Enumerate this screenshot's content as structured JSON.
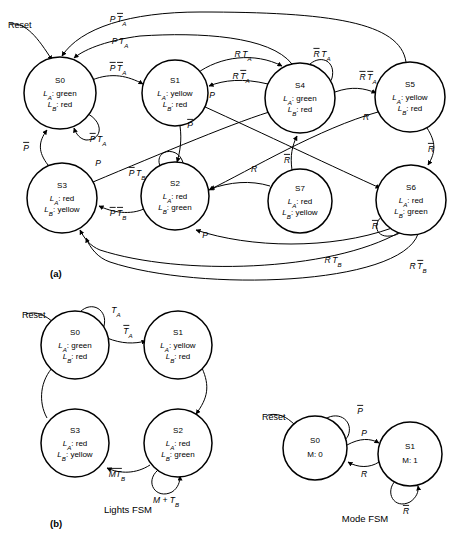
{
  "figure": {
    "part_a_label": "(a)",
    "part_b_label": "(b)",
    "lights_fsm_caption": "Lights FSM",
    "mode_fsm_caption": "Mode FSM",
    "reset_label": "Reset"
  },
  "outputs": {
    "la": "L",
    "la_sub": "A",
    "lb": "L",
    "lb_sub": "B",
    "colon": ":",
    "green": "green",
    "red": "red",
    "yellow": "yellow"
  },
  "diagram_a": {
    "states": [
      {
        "id": "S0",
        "name": "S0",
        "la": "green",
        "lb": "red",
        "cx": 60,
        "cy": 93,
        "r": 36
      },
      {
        "id": "S1",
        "name": "S1",
        "la": "yellow",
        "lb": "red",
        "cx": 175,
        "cy": 93,
        "r": 33
      },
      {
        "id": "S4",
        "name": "S4",
        "la": "green",
        "lb": "red",
        "cx": 300,
        "cy": 98,
        "r": 35
      },
      {
        "id": "S5",
        "name": "S5",
        "la": "yellow",
        "lb": "red",
        "cx": 410,
        "cy": 97,
        "r": 35
      },
      {
        "id": "S3",
        "name": "S3",
        "la": "red",
        "lb": "yellow",
        "cx": 62,
        "cy": 198,
        "r": 35
      },
      {
        "id": "S2",
        "name": "S2",
        "la": "red",
        "lb": "green",
        "cx": 175,
        "cy": 196,
        "r": 34
      },
      {
        "id": "S7",
        "name": "S7",
        "la": "red",
        "lb": "yellow",
        "cx": 300,
        "cy": 201,
        "r": 32
      },
      {
        "id": "S6",
        "name": "S6",
        "la": "red",
        "lb": "green",
        "cx": 411,
        "cy": 200,
        "r": 35
      }
    ],
    "transitions": [
      {
        "from": "S5",
        "to": "S0",
        "label": "P T̅A",
        "main": "P",
        "bar": "T",
        "sub": "A",
        "barred": true,
        "lx": 118,
        "ly": 22
      },
      {
        "from": "S4",
        "to": "S0",
        "label": "P TA",
        "main": "P",
        "bar": "T",
        "sub": "A",
        "barred": false,
        "lx": 120,
        "ly": 44
      },
      {
        "from": "S0",
        "to": "S1",
        "label": "P̅ T̅A",
        "main": "P",
        "bar": "T",
        "sub": "A",
        "barred": true,
        "lx": 120,
        "ly": 71
      },
      {
        "from": "S0",
        "to": "S0",
        "label": "P̅ TA",
        "main": "P",
        "bar": "T",
        "sub": "A",
        "barred": false,
        "lx": 96,
        "ly": 139
      },
      {
        "from": "S1",
        "to": "S4",
        "label": "R TA",
        "main": "R",
        "bar": "T",
        "sub": "A",
        "barred": false,
        "lx": 243,
        "ly": 57
      },
      {
        "from": "S4",
        "to": "S1",
        "label": "R T̅A",
        "main": "R",
        "bar": "T",
        "sub": "A",
        "barred": true,
        "lx": 240,
        "ly": 79
      },
      {
        "from": "S4",
        "to": "S4",
        "label": "R̅ TA",
        "main": "R",
        "bar": "T",
        "sub": "A",
        "barred": false,
        "lx": 322,
        "ly": 57
      },
      {
        "from": "S4",
        "to": "S5",
        "label": "R̅ T̅A",
        "main": "R",
        "bar": "T",
        "sub": "A",
        "barred": true,
        "lx": 367,
        "ly": 81
      },
      {
        "from": "S5",
        "to": "S6",
        "label": "R̅",
        "main": "R",
        "barred": true,
        "lx": 428,
        "ly": 152
      },
      {
        "from": "S5",
        "to": "S2",
        "label": "R",
        "main": "R",
        "barred": false,
        "lx": 368,
        "ly": 119
      },
      {
        "from": "S1",
        "to": "S2",
        "label": "P̅",
        "main": "P",
        "barred": true,
        "lx": 188,
        "ly": 128
      },
      {
        "from": "S1",
        "to": "S6",
        "label": "P",
        "main": "P",
        "barred": false,
        "lx": 211,
        "ly": 98
      },
      {
        "from": "S3",
        "to": "S0",
        "label": "P̅",
        "main": "P",
        "barred": true,
        "lx": 27,
        "ly": 150
      },
      {
        "from": "S3",
        "to": "S4",
        "label": "P",
        "main": "P",
        "barred": false,
        "lx": 98,
        "ly": 166
      },
      {
        "from": "S2",
        "to": "S2",
        "label": "P̅ TB",
        "main": "P",
        "bar": "T",
        "sub": "B",
        "barred": false,
        "lx": 137,
        "ly": 175
      },
      {
        "from": "S2",
        "to": "S3",
        "label": "P̅ T̅B",
        "main": "P",
        "bar": "T",
        "sub": "B",
        "barred": true,
        "lx": 117,
        "ly": 213
      },
      {
        "from": "S7",
        "to": "S4",
        "label": "R̅",
        "main": "R",
        "barred": true,
        "lx": 286,
        "ly": 163
      },
      {
        "from": "S7",
        "to": "S2",
        "label": "R",
        "main": "R",
        "barred": false,
        "lx": 254,
        "ly": 172
      },
      {
        "from": "S6",
        "to": "S6",
        "label": "R̅",
        "main": "R",
        "barred": true,
        "lx": 376,
        "ly": 228
      },
      {
        "from": "S6",
        "to": "S2",
        "label": "P",
        "main": "P",
        "barred": false,
        "lx": 205,
        "ly": 237
      },
      {
        "from": "S6",
        "to": "S3",
        "label": "R TB",
        "main": "R",
        "bar": "T",
        "sub": "B",
        "barred": false,
        "lx": 333,
        "ly": 263
      },
      {
        "from": "S6",
        "to": "S3",
        "label": "R T̅B",
        "main": "R",
        "bar": "T",
        "sub": "B",
        "barred": true,
        "lx": 418,
        "ly": 268
      }
    ]
  },
  "lights_fsm": {
    "states": [
      {
        "id": "S0",
        "name": "S0",
        "la": "green",
        "lb": "red",
        "cx": 75,
        "cy": 345,
        "r": 34
      },
      {
        "id": "S1",
        "name": "S1",
        "la": "yellow",
        "lb": "red",
        "cx": 178,
        "cy": 345,
        "r": 34
      },
      {
        "id": "S3",
        "name": "S3",
        "la": "red",
        "lb": "yellow",
        "cx": 75,
        "cy": 443,
        "r": 34
      },
      {
        "id": "S2",
        "name": "S2",
        "la": "red",
        "lb": "green",
        "cx": 178,
        "cy": 443,
        "r": 34
      }
    ],
    "transitions": [
      {
        "from": "S0",
        "to": "S0",
        "main": "T",
        "sub": "A",
        "barred": false,
        "lx": 113,
        "ly": 312
      },
      {
        "from": "S0",
        "to": "S1",
        "main": "T",
        "sub": "A",
        "barred": true,
        "lx": 126,
        "ly": 336
      },
      {
        "from": "S2",
        "to": "S3",
        "main": "MT",
        "sub": "B",
        "barred": true,
        "lx": 117,
        "ly": 470
      },
      {
        "from": "S2",
        "to": "S2",
        "main": "M + T",
        "sub": "B",
        "barred": false,
        "lx": 165,
        "ly": 492
      }
    ]
  },
  "mode_fsm": {
    "states": [
      {
        "id": "S0",
        "name": "S0",
        "out": "M: 0",
        "cx": 315,
        "cy": 448,
        "r": 32
      },
      {
        "id": "S1",
        "name": "S1",
        "out": "M: 1",
        "cx": 410,
        "cy": 454,
        "r": 32
      }
    ],
    "transitions": [
      {
        "from": "S0",
        "to": "S0",
        "main": "P",
        "barred": true,
        "lx": 359,
        "ly": 414
      },
      {
        "from": "S0",
        "to": "S1",
        "main": "P",
        "barred": false,
        "lx": 363,
        "ly": 435
      },
      {
        "from": "S1",
        "to": "S0",
        "main": "R",
        "barred": false,
        "lx": 363,
        "ly": 473
      },
      {
        "from": "S1",
        "to": "S1",
        "main": "R",
        "barred": true,
        "lx": 406,
        "ly": 500
      }
    ]
  }
}
